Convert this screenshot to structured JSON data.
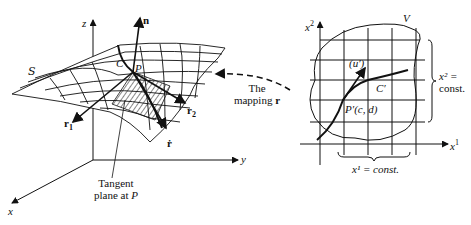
{
  "left_figure": {
    "axis_z": "z",
    "axis_y": "y",
    "axis_x": "x",
    "surface_label": "S",
    "curve_label": "C",
    "point_label": "P",
    "normal_label": "n",
    "r1_label": "r",
    "r1_sub": "1",
    "r2_label": "r",
    "r2_sub": "2",
    "rdot_label": "ṙ",
    "tangent_line1": "Tangent",
    "tangent_line2": "plane at",
    "tangent_point": "P"
  },
  "mapping": {
    "line1": "The",
    "line2": "mapping",
    "symbol": "r"
  },
  "right_figure": {
    "axis_x2": "x",
    "axis_x2_sup": "2",
    "axis_x1": "x",
    "axis_x1_sup": "1",
    "region_label": "V",
    "curve_label": "C′",
    "vector_label": "(u′)",
    "point_label": "P′(c, d)",
    "x2_const_line1": "x² =",
    "x2_const_line2": "const.",
    "x1_const": "x¹ = const."
  }
}
